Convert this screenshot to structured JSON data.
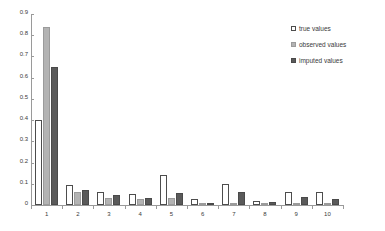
{
  "chart_data": {
    "type": "bar",
    "title": "",
    "subtitle": "",
    "xlabel": "",
    "ylabel": "",
    "categories": [
      "1",
      "2",
      "3",
      "4",
      "5",
      "6",
      "7",
      "8",
      "9",
      "10"
    ],
    "series": [
      {
        "name": "true values",
        "color": "#ffffff",
        "values": [
          0.4,
          0.095,
          0.06,
          0.05,
          0.14,
          0.03,
          0.1,
          0.02,
          0.06,
          0.06
        ]
      },
      {
        "name": "observed values",
        "color": "#b3b3b3",
        "values": [
          0.84,
          0.06,
          0.035,
          0.03,
          0.035,
          0.003,
          0.008,
          0.005,
          0.004,
          0.003
        ]
      },
      {
        "name": "imputed values",
        "color": "#5a5a5a",
        "values": [
          0.65,
          0.07,
          0.045,
          0.035,
          0.055,
          0.008,
          0.06,
          0.012,
          0.04,
          0.03
        ]
      }
    ],
    "ylim": [
      0,
      0.9
    ],
    "y_ticks": [
      "0",
      "0.1",
      "0.2",
      "0.3",
      "0.4",
      "0.5",
      "0.6",
      "0.7",
      "0.8",
      "0.9"
    ],
    "y_tick_values": [
      0,
      0.1,
      0.2,
      0.3,
      0.4,
      0.5,
      0.6,
      0.7,
      0.8,
      0.9
    ],
    "grid": false,
    "legend_position": "top-right",
    "legend_entries": [
      "true values",
      "observed values",
      "imputed values"
    ]
  },
  "legend": {
    "items": [
      {
        "label": "true values",
        "swatch": "legend-swatch-true"
      },
      {
        "label": "observed values",
        "swatch": "legend-swatch-observed"
      },
      {
        "label": "imputed values",
        "swatch": "legend-swatch-imputed"
      }
    ]
  }
}
